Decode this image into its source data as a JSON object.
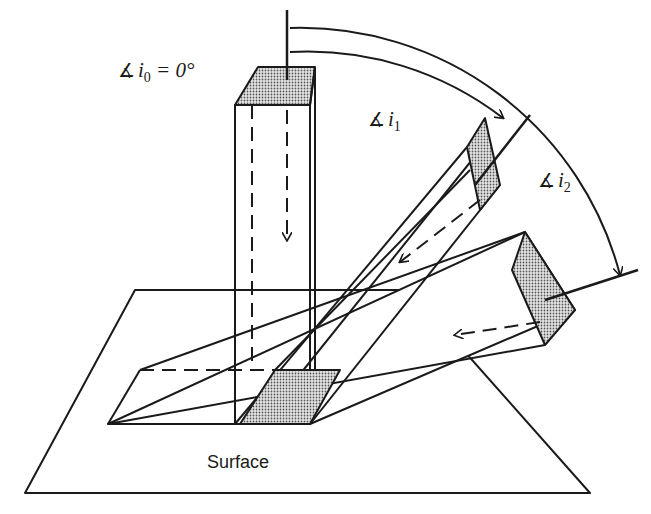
{
  "figure": {
    "labels": {
      "angle0": {
        "symbol": "∡",
        "var": "i",
        "sub": "0",
        "suffix": " = 0°"
      },
      "angle1": {
        "symbol": "∡",
        "var": "i",
        "sub": "1"
      },
      "angle2": {
        "symbol": "∡",
        "var": "i",
        "sub": "2"
      },
      "surface": "Surface"
    },
    "colors": {
      "line": "#1a1a1a",
      "shade": "#8a8a8a",
      "background": "#ffffff"
    }
  }
}
